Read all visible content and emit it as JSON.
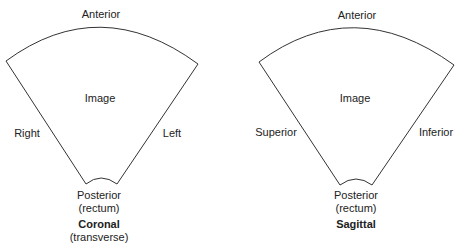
{
  "diagrams": [
    {
      "title": "Coronal",
      "subtitle": "(transverse)",
      "top": "Anterior",
      "center": "Image",
      "left": "Right",
      "right": "Left",
      "bottom_line1": "Posterior",
      "bottom_line2": "(rectum)"
    },
    {
      "title": "Sagittal",
      "subtitle": "",
      "top": "Anterior",
      "center": "Image",
      "left": "Superior",
      "right": "Inferior",
      "bottom_line1": "Posterior",
      "bottom_line2": "(rectum)"
    }
  ],
  "colors": {
    "stroke": "#333333",
    "text": "#222222"
  }
}
